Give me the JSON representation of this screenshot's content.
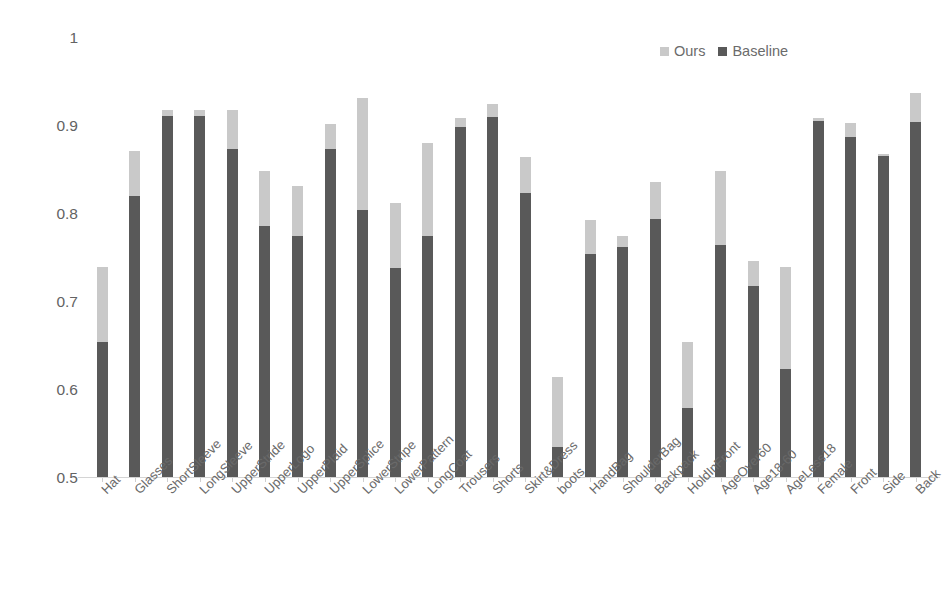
{
  "chart_data": {
    "type": "bar",
    "subtype": "stacked-overlay",
    "title": "",
    "xlabel": "",
    "ylabel": "",
    "ylim": [
      0.5,
      1.0
    ],
    "yticks": [
      "0.5",
      "0.6",
      "0.7",
      "0.8",
      "0.9",
      "1"
    ],
    "ytick_values": [
      0.5,
      0.6,
      0.7,
      0.8,
      0.9,
      1.0
    ],
    "grid": false,
    "legend_position": "top-right",
    "categories": [
      "Hat",
      "Glasses",
      "ShortSleeve",
      "LongSleeve",
      "UpperStride",
      "UpperLogo",
      "UpperPlaid",
      "UpperSplice",
      "LowerStripe",
      "LowerPattern",
      "LongCoat",
      "Trousers",
      "Shorts",
      "Skirt&Dress",
      "boots",
      "HandBag",
      "ShoulderBag",
      "Backpack",
      "HoldInFront",
      "AgeOver60",
      "Age18-60",
      "AgeLess18",
      "Female",
      "Front",
      "Side",
      "Back"
    ],
    "series": [
      {
        "name": "Ours",
        "color": "#c9c9c9",
        "values": [
          0.74,
          0.872,
          0.918,
          0.918,
          0.918,
          0.849,
          0.832,
          0.902,
          0.932,
          0.813,
          0.881,
          0.909,
          0.925,
          0.865,
          0.615,
          0.793,
          0.775,
          0.836,
          0.654,
          0.849,
          0.747,
          0.74,
          0.909,
          0.903,
          0.868,
          0.937
        ]
      },
      {
        "name": "Baseline",
        "color": "#595959",
        "values": [
          0.655,
          0.821,
          0.911,
          0.911,
          0.874,
          0.786,
          0.775,
          0.874,
          0.805,
          0.739,
          0.775,
          0.899,
          0.91,
          0.824,
          0.535,
          0.754,
          0.762,
          0.794,
          0.579,
          0.765,
          0.718,
          0.624,
          0.906,
          0.888,
          0.866,
          0.905
        ]
      }
    ]
  },
  "legend": {
    "entries": [
      {
        "label": "Ours",
        "color": "#c9c9c9"
      },
      {
        "label": "Baseline",
        "color": "#595959"
      }
    ]
  },
  "colors": {
    "ours": "#c9c9c9",
    "baseline": "#595959",
    "axis": "#d4d4d4",
    "text": "#636363",
    "background": "#ffffff"
  }
}
